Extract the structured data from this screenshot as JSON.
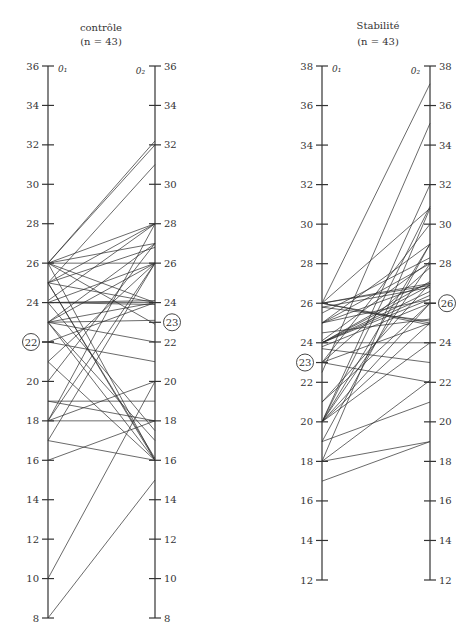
{
  "chart_data": [
    {
      "type": "line",
      "subtype": "paired-parallel-axes",
      "title": "contrôle",
      "subtitle": "(n = 43)",
      "left_axis_label": "0₁",
      "right_axis_label": "0₂",
      "ylim": [
        8,
        36
      ],
      "ticks": [
        8,
        10,
        12,
        14,
        16,
        18,
        20,
        22,
        24,
        26,
        28,
        30,
        32,
        34,
        36
      ],
      "mean_left": 22,
      "mean_right": 23,
      "pairs": [
        [
          26,
          32.2
        ],
        [
          26,
          32
        ],
        [
          26,
          28
        ],
        [
          26,
          27
        ],
        [
          26,
          26
        ],
        [
          26,
          24
        ],
        [
          26,
          22.9
        ],
        [
          26,
          16
        ],
        [
          25,
          31
        ],
        [
          25,
          28
        ],
        [
          25,
          26.8
        ],
        [
          25,
          24
        ],
        [
          25,
          16.1
        ],
        [
          25,
          16
        ],
        [
          24.1,
          28
        ],
        [
          24,
          26
        ],
        [
          24,
          24
        ],
        [
          24,
          24.1
        ],
        [
          24,
          23.9
        ],
        [
          23,
          27
        ],
        [
          23,
          26
        ],
        [
          23,
          24
        ],
        [
          23,
          23.1
        ],
        [
          23,
          22
        ],
        [
          23,
          17
        ],
        [
          22,
          24
        ],
        [
          22,
          21
        ],
        [
          21,
          26
        ],
        [
          20,
          27
        ],
        [
          19,
          19
        ],
        [
          19,
          18
        ],
        [
          18,
          28
        ],
        [
          18,
          20
        ],
        [
          18,
          18
        ],
        [
          18,
          26
        ],
        [
          17,
          16
        ],
        [
          17,
          26
        ],
        [
          16,
          18
        ],
        [
          10,
          20
        ],
        [
          8,
          15
        ],
        [
          21,
          16
        ],
        [
          24,
          17.5
        ],
        [
          23,
          16
        ]
      ]
    },
    {
      "type": "line",
      "subtype": "paired-parallel-axes",
      "title": "Stabilité",
      "subtitle": "(n = 43)",
      "left_axis_label": "0₁",
      "right_axis_label": "0₂",
      "ylim": [
        12,
        38
      ],
      "ticks": [
        12,
        14,
        16,
        18,
        20,
        22,
        24,
        26,
        28,
        30,
        32,
        34,
        36,
        38
      ],
      "mean_left": 23,
      "mean_right": 26,
      "pairs": [
        [
          26,
          37.1
        ],
        [
          26,
          30.8
        ],
        [
          26,
          27
        ],
        [
          26,
          26.9
        ],
        [
          26,
          25
        ],
        [
          26,
          24.9
        ],
        [
          25.8,
          26.8
        ],
        [
          25.8,
          25.1
        ],
        [
          25,
          29
        ],
        [
          25,
          28
        ],
        [
          25,
          27
        ],
        [
          25,
          26.2
        ],
        [
          24.1,
          28.1
        ],
        [
          24,
          27.1
        ],
        [
          24,
          26.9
        ],
        [
          24,
          26.6
        ],
        [
          24,
          26.4
        ],
        [
          24,
          26.2
        ],
        [
          24,
          24
        ],
        [
          23.8,
          26
        ],
        [
          23.7,
          23
        ],
        [
          23,
          30
        ],
        [
          23,
          27.8
        ],
        [
          23,
          25
        ],
        [
          23,
          22
        ],
        [
          22.5,
          35.1
        ],
        [
          21,
          27
        ],
        [
          21,
          26
        ],
        [
          20,
          32
        ],
        [
          20,
          30.9
        ],
        [
          20,
          29
        ],
        [
          20,
          28
        ],
        [
          20,
          26
        ],
        [
          20,
          25
        ],
        [
          20,
          24
        ],
        [
          19,
          21
        ],
        [
          19,
          29
        ],
        [
          18,
          19
        ],
        [
          18,
          30.8
        ],
        [
          18,
          22.1
        ],
        [
          17,
          19
        ],
        [
          24.5,
          25.2
        ],
        [
          25.5,
          28.3
        ]
      ]
    }
  ],
  "labels": {
    "left_title": "contrôle",
    "left_subtitle": "(n = 43)",
    "right_title": "Stabilité",
    "right_subtitle": "(n = 43)",
    "axis_o1": "0₁",
    "axis_o2": "0₂"
  }
}
